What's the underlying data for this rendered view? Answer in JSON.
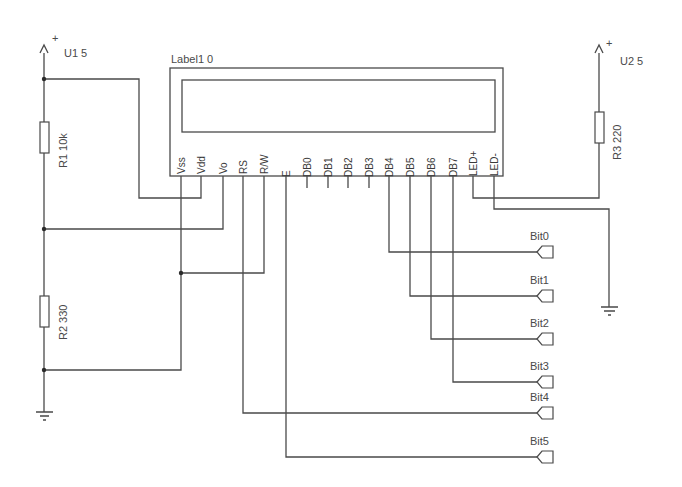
{
  "lcd": {
    "label": "Label1 0",
    "pins": [
      "Vss",
      "Vdd",
      "Vo",
      "RS",
      "R/W",
      "E",
      "DB0",
      "DB1",
      "DB2",
      "DB3",
      "DB4",
      "DB5",
      "DB6",
      "DB7",
      "LED+",
      "LED-"
    ],
    "pin_x": [
      181,
      201,
      223,
      243,
      264,
      286,
      307,
      328,
      348,
      369,
      389,
      410,
      431,
      453,
      473,
      494
    ]
  },
  "power": [
    {
      "name": "U1 5",
      "symbol": "+",
      "x": 44,
      "y": 46
    },
    {
      "name": "U2 5",
      "symbol": "+",
      "x": 599,
      "y": 46
    }
  ],
  "resistors": [
    {
      "ref": "R1",
      "value": "10k",
      "label": "R1 10k",
      "x": 44,
      "y": 122
    },
    {
      "ref": "R2",
      "value": "330",
      "label": "R2 330",
      "x": 44,
      "y": 296
    },
    {
      "ref": "R3",
      "value": "220",
      "label": "R3 220",
      "x": 599,
      "y": 112
    }
  ],
  "connectors": [
    {
      "label": "Bit0",
      "pin": "DB4",
      "y": 252
    },
    {
      "label": "Bit1",
      "pin": "DB5",
      "y": 296
    },
    {
      "label": "Bit2",
      "pin": "DB6",
      "y": 339
    },
    {
      "label": "Bit3",
      "pin": "DB7",
      "y": 382
    },
    {
      "label": "Bit4",
      "pin": "RS",
      "y": 413
    },
    {
      "label": "Bit5",
      "pin": "E",
      "y": 457
    }
  ],
  "grounds": [
    {
      "name": "gnd-left",
      "x": 44,
      "y": 412
    },
    {
      "name": "gnd-right",
      "x": 609,
      "y": 307
    }
  ],
  "colors": {
    "wire": "#4a4a4a",
    "background": "#ffffff"
  }
}
